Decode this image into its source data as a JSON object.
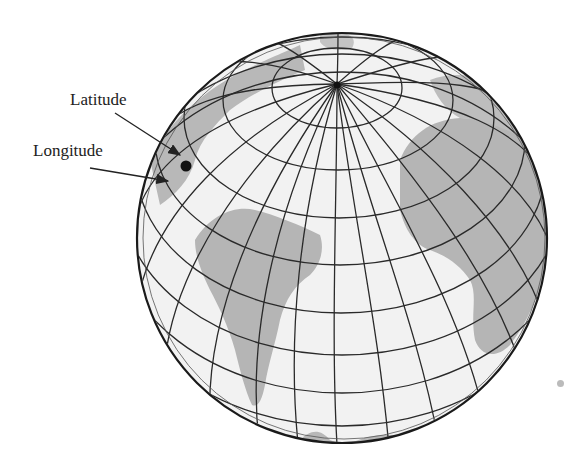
{
  "figure": {
    "labels": {
      "latitude": "Latitude",
      "longitude": "Longitude"
    },
    "colors": {
      "ocean": "#f2f2f2",
      "land": "#b5b5b5",
      "grid": "#2a2a2a",
      "outline": "#1a1a1a",
      "point": "#111111"
    },
    "globe": {
      "cx": 342,
      "cy": 238,
      "r": 205,
      "pole": [
        337,
        84
      ]
    },
    "marked_point": [
      186,
      166
    ]
  }
}
